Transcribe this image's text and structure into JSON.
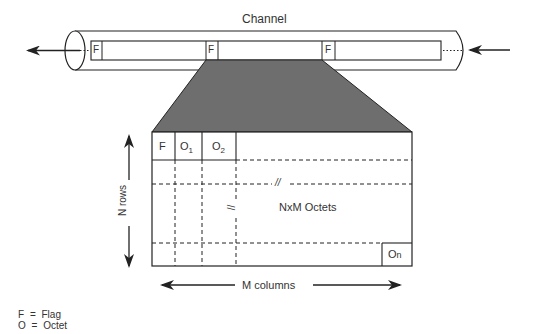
{
  "title": "Channel",
  "channel": {
    "frame_flags": [
      "F",
      "F",
      "F"
    ],
    "left_arrow": "arrow-left",
    "right_arrow": "arrow-left"
  },
  "table": {
    "header_cells": [
      "F",
      "O",
      "O"
    ],
    "header_subscripts": [
      "",
      "1",
      "2"
    ],
    "center_label": "NxM Octets",
    "last_cell_main": "O",
    "last_cell_sub": "n",
    "break_marks": [
      "//",
      "//"
    ],
    "rows_label": "N rows",
    "columns_label": "M columns"
  },
  "legend": [
    {
      "symbol": "F",
      "eq": "=",
      "meaning": "Flag"
    },
    {
      "symbol": "O",
      "eq": "=",
      "meaning": "Octet"
    }
  ],
  "colors": {
    "line": "#222222",
    "trapezoid_fill": "#6e6e6e",
    "background": "#ffffff"
  }
}
